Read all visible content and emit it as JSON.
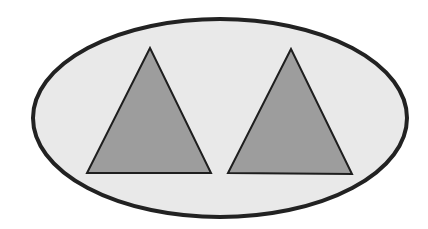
{
  "diagram": {
    "background": "#ffffff",
    "ellipse": {
      "cx": 220,
      "cy": 118,
      "rx": 187,
      "ry": 99,
      "fill": "#e9e9e9",
      "stroke": "#222222",
      "stroke_width": 4
    },
    "triangles": [
      {
        "id": "left",
        "points": "150,48 87,173 211,173",
        "fill": "#9d9d9d",
        "stroke": "#1e1e1e",
        "stroke_width": 2
      },
      {
        "id": "right",
        "points": "291,49 228,173 352,174",
        "fill": "#9d9d9d",
        "stroke": "#1e1e1e",
        "stroke_width": 2
      }
    ]
  }
}
